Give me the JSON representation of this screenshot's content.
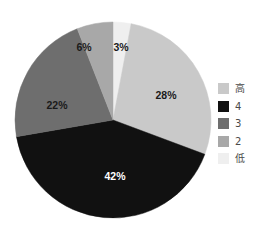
{
  "chart_data": {
    "type": "pie",
    "title": "",
    "categories": [
      "高",
      "4",
      "3",
      "2",
      "低"
    ],
    "values": [
      28,
      42,
      22,
      6,
      3
    ],
    "labels": [
      "28%",
      "42%",
      "22%",
      "6%",
      "3%"
    ],
    "colors": [
      "#c9c9c9",
      "#111111",
      "#6e6e6e",
      "#a8a8a8",
      "#efefef"
    ],
    "label_text_colors": [
      "#1a1a1a",
      "#ffffff",
      "#1a1a1a",
      "#1a1a1a",
      "#1a1a1a"
    ],
    "start_angle_deg": 0,
    "direction": "clockwise",
    "grid": false,
    "legend_position": "right",
    "xlabel": "",
    "ylabel": ""
  },
  "slices": [
    {
      "name": "low",
      "legend_label": "低",
      "value": 3,
      "label": "3%",
      "color": "#efefef",
      "label_x": 121,
      "label_y": 47,
      "label_tone": "dark"
    },
    {
      "name": "high",
      "legend_label": "高",
      "value": 28,
      "label": "28%",
      "color": "#c9c9c9",
      "label_x": 166,
      "label_y": 95,
      "label_tone": "dark"
    },
    {
      "name": "four",
      "legend_label": "4",
      "value": 42,
      "label": "42%",
      "color": "#111111",
      "label_x": 115,
      "label_y": 176,
      "label_tone": "light"
    },
    {
      "name": "three",
      "legend_label": "3",
      "value": 22,
      "label": "22%",
      "color": "#6e6e6e",
      "label_x": 57,
      "label_y": 105,
      "label_tone": "dark"
    },
    {
      "name": "two",
      "legend_label": "2",
      "value": 6,
      "label": "6%",
      "color": "#a8a8a8",
      "label_x": 84,
      "label_y": 47,
      "label_tone": "dark"
    }
  ],
  "legend": {
    "items": [
      {
        "label": "高",
        "color": "#c9c9c9"
      },
      {
        "label": "4",
        "color": "#111111"
      },
      {
        "label": "3",
        "color": "#6e6e6e"
      },
      {
        "label": "2",
        "color": "#a8a8a8"
      },
      {
        "label": "低",
        "color": "#efefef"
      }
    ]
  },
  "geometry": {
    "center_x": 113,
    "center_y": 120,
    "radius": 98
  }
}
